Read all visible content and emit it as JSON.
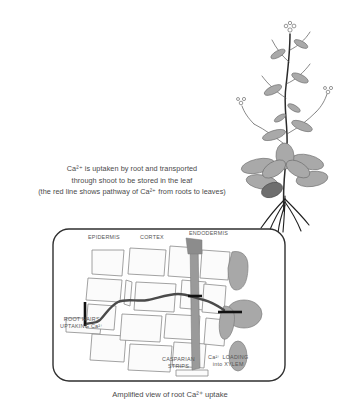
{
  "figure": {
    "caption_lines": [
      "Ca²⁺ is uptaken by root and transported",
      "through shoot to be stored in the leaf",
      "(the red line shows pathway of Ca²⁺ from roots to leaves)"
    ],
    "bottom_caption": "Amplified view of root Ca²⁺ uptake"
  },
  "diagram": {
    "labels": {
      "epidermis": "EPIDERMIS",
      "cortex": "CORTEX",
      "endodermis": "ENDODERMIS",
      "root_hairs_line1": "ROOT HAIRS",
      "root_hairs_line2": "UPTAKING Ca²⁺",
      "casparian_line1": "CASPARIAN",
      "casparian_line2": "STRIPS",
      "loading_line1": "Ca²⁺ LOADING",
      "loading_line2": "into XYLEM"
    }
  },
  "colors": {
    "pathway_line": "#4a4a4a",
    "cell_fill": "#fbfbfb",
    "cell_stroke": "#8a8a8a",
    "casparian_fill": "#9a9a9a",
    "xylem_fill": "#a8a8a8",
    "leaf_fill": "#a9a9a9",
    "dark_leaf_fill": "#6e6e6e",
    "stem_stroke": "#2b2b2b",
    "text": "#4a4a4a",
    "box_stroke": "#2f2f2f"
  }
}
